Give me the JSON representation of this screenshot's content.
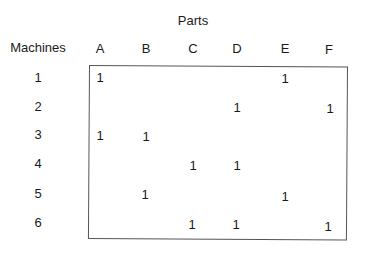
{
  "diagram": {
    "title_columns": "Parts",
    "title_rows": "Machines",
    "columns": [
      "A",
      "B",
      "C",
      "D",
      "E",
      "F"
    ],
    "rows": [
      "1",
      "2",
      "3",
      "4",
      "5",
      "6"
    ],
    "matrix": [
      [
        "1",
        "",
        "",
        "",
        "1",
        ""
      ],
      [
        "",
        "",
        "",
        "1",
        "",
        "1"
      ],
      [
        "1",
        "1",
        "",
        "",
        "",
        ""
      ],
      [
        "",
        "",
        "1",
        "1",
        "",
        ""
      ],
      [
        "",
        "1",
        "",
        "",
        "1",
        ""
      ],
      [
        "",
        "",
        "1",
        "1",
        "",
        "1"
      ]
    ],
    "colors": {
      "text": "#1a1a1a",
      "border": "#555555",
      "background": "#ffffff"
    }
  }
}
